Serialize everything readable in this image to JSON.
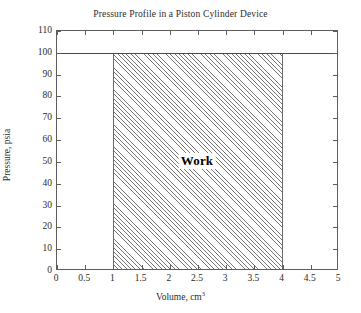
{
  "chart_data": {
    "type": "area",
    "title": "Pressure Profile in a Piston Cylinder Device",
    "xlabel_text": "Volume, cm",
    "xlabel_sup": "3",
    "ylabel": "Pressure, psia",
    "xlim": [
      0,
      5
    ],
    "ylim": [
      0,
      110
    ],
    "xticks": [
      0,
      0.5,
      1,
      1.5,
      2,
      2.5,
      3,
      3.5,
      4,
      4.5,
      5
    ],
    "xtick_labels": [
      "0",
      "0.5",
      "1",
      "1.5",
      "2",
      "2.5",
      "3",
      "3.5",
      "4",
      "4.5",
      "5"
    ],
    "yticks": [
      0,
      10,
      20,
      30,
      40,
      50,
      60,
      70,
      80,
      90,
      100,
      110
    ],
    "ytick_labels": [
      "0",
      "10",
      "20",
      "30",
      "40",
      "50",
      "60",
      "70",
      "80",
      "90",
      "100",
      "110"
    ],
    "grid": false,
    "legend": false,
    "series": [
      {
        "name": "Constant pressure process",
        "type": "line",
        "x": [
          0,
          5
        ],
        "values": [
          100,
          100
        ]
      },
      {
        "name": "Work",
        "type": "area",
        "x_start": 1,
        "x_end": 4,
        "y_start": 0,
        "y_end": 100,
        "hatch": "diagonal",
        "fill": "#ffffff",
        "edge": "#6a6a6a"
      }
    ],
    "annotations": [
      {
        "label": "Work",
        "x": 2.5,
        "y": 50,
        "bold": true
      }
    ]
  },
  "colors": {
    "axis": "#5d5d5d",
    "text": "#2b2b2b",
    "line": "#4a4a4a",
    "hatch": "#757575",
    "background": "#ffffff"
  }
}
